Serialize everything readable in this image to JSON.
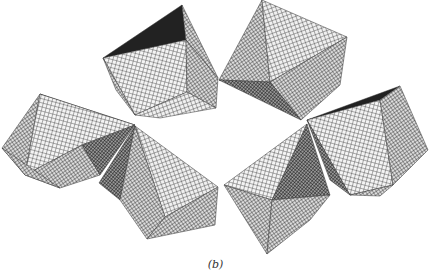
{
  "figure": {
    "caption": "(b)",
    "octahedra_count": 6
  },
  "colors": {
    "background": "#ffffff",
    "line": "#111111",
    "dark_face": "#222222"
  }
}
